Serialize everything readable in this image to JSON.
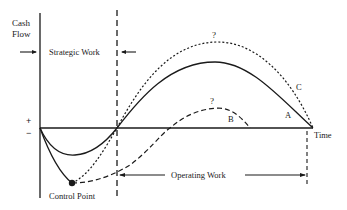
{
  "diagram": {
    "y_axis_label_line1": "Cash",
    "y_axis_label_line2": "Flow",
    "x_axis_label": "Time",
    "plus_sign": "+",
    "minus_sign": "−",
    "strategic_work_label": "Strategic Work",
    "operating_work_label": "Operating Work",
    "control_point_label": "Control Point",
    "curves": [
      {
        "id": "A",
        "label": "A",
        "style": "solid"
      },
      {
        "id": "B",
        "label": "B",
        "style": "dashed"
      },
      {
        "id": "C",
        "label": "C",
        "style": "dotted"
      }
    ],
    "question_marks": [
      "?",
      "?"
    ],
    "colors": {
      "ink": "#1a1a1a",
      "background": "#ffffff"
    }
  }
}
